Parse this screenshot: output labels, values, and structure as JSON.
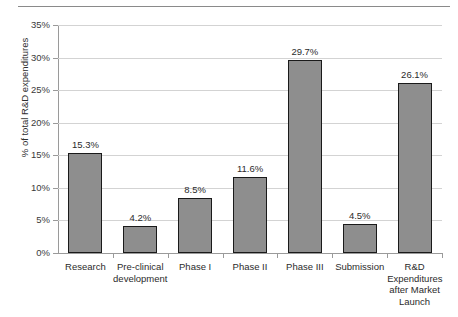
{
  "chart_data": {
    "type": "bar",
    "title": "",
    "xlabel": "",
    "ylabel": "% of total R&D expenditures",
    "ylim": [
      0,
      35
    ],
    "ytick_step": 5,
    "grid": true,
    "legend": "none",
    "categories": [
      "Research",
      "Pre-clinical development",
      "Phase I",
      "Phase II",
      "Phase III",
      "Submission",
      "R&D Expenditures after Market Launch"
    ],
    "category_lines": [
      [
        "Research"
      ],
      [
        "Pre-clinical",
        "development"
      ],
      [
        "Phase I"
      ],
      [
        "Phase II"
      ],
      [
        "Phase III"
      ],
      [
        "Submission"
      ],
      [
        "R&D",
        "Expenditures",
        "after Market",
        "Launch"
      ]
    ],
    "values": [
      15.3,
      4.2,
      8.5,
      11.6,
      29.7,
      4.5,
      26.1
    ],
    "data_labels": [
      "15.3%",
      "4.2%",
      "8.5%",
      "11.6%",
      "29.7%",
      "4.5%",
      "26.1%"
    ],
    "ytick_labels": [
      "0%",
      "5%",
      "10%",
      "15%",
      "20%",
      "25%",
      "30%",
      "35%"
    ],
    "ytick_values": [
      0,
      5,
      10,
      15,
      20,
      25,
      30,
      35
    ],
    "colors": {
      "bar_fill": "#8e8e8e",
      "bar_border": "#1a1a1a",
      "gridline": "#d3d3d3",
      "axis": "#9a9a9a",
      "text": "#2b2b2b",
      "background": "#ffffff",
      "top_rule": "#8a8a8a"
    }
  }
}
